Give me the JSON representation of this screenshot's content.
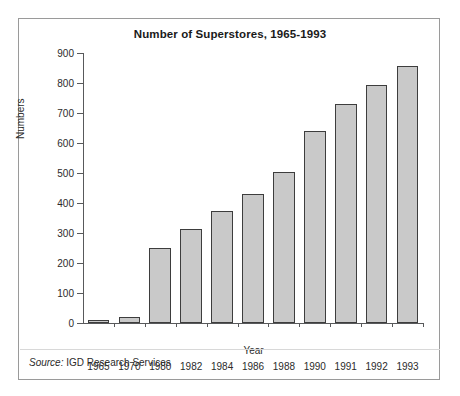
{
  "chart_data": {
    "type": "bar",
    "title": "Number of Superstores, 1965-1993",
    "xlabel": "Year",
    "ylabel": "Numbers",
    "categories": [
      "1965",
      "1970",
      "1980",
      "1982",
      "1984",
      "1986",
      "1988",
      "1990",
      "1991",
      "1992",
      "1993"
    ],
    "values": [
      5,
      20,
      250,
      312,
      372,
      430,
      505,
      640,
      730,
      793,
      858
    ],
    "ylim": [
      0,
      900
    ],
    "ytick_values": [
      0,
      100,
      200,
      300,
      400,
      500,
      600,
      700,
      800,
      900
    ],
    "ytick_labels": [
      "0",
      "100",
      "200",
      "300",
      "400",
      "500",
      "600",
      "700",
      "800",
      "900"
    ],
    "grid": false,
    "legend": null,
    "bar_fill_color": "#c9c9c9",
    "bar_edge_color": "#3d3d3d",
    "axis_color": "#58595b",
    "frame_color": "#9a9a9a"
  },
  "footer": {
    "source_lead": "Source:",
    "source_text": "IGD Research Services"
  }
}
